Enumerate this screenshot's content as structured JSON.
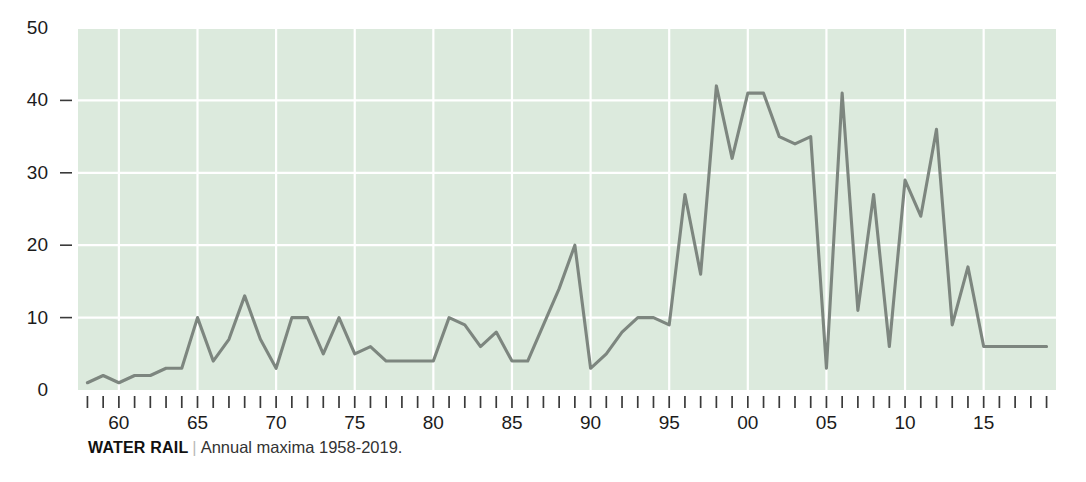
{
  "caption": {
    "species": "WATER RAIL",
    "separator": "|",
    "subtitle": "Annual maxima 1958-2019."
  },
  "style": {
    "plot_background": "#dceadd",
    "gridline_color": "#ffffff",
    "line_color": "#7d867f",
    "tick_color": "#3a3a3a",
    "label_color": "#1b1b1b"
  },
  "chart_data": {
    "type": "line",
    "title": "WATER RAIL",
    "subtitle": "Annual maxima 1958-2019.",
    "xlabel": "",
    "ylabel": "",
    "xlim": [
      1957.4,
      2019.6
    ],
    "ylim": [
      0,
      50
    ],
    "grid": true,
    "legend_position": "none",
    "y_ticks": [
      0,
      10,
      20,
      30,
      40,
      50
    ],
    "y_tick_labels": [
      "0",
      "10",
      "20",
      "30",
      "40",
      "50"
    ],
    "x_ticks": [
      1960,
      1965,
      1970,
      1975,
      1980,
      1985,
      1990,
      1995,
      2000,
      2005,
      2010,
      2015
    ],
    "x_tick_labels": [
      "60",
      "65",
      "70",
      "75",
      "80",
      "85",
      "90",
      "95",
      "00",
      "05",
      "10",
      "15"
    ],
    "x_minor_ticks_every": 1,
    "x": [
      1958,
      1959,
      1960,
      1961,
      1962,
      1963,
      1964,
      1965,
      1966,
      1967,
      1968,
      1969,
      1970,
      1971,
      1972,
      1973,
      1974,
      1975,
      1976,
      1977,
      1978,
      1979,
      1980,
      1981,
      1982,
      1983,
      1984,
      1985,
      1986,
      1987,
      1988,
      1989,
      1990,
      1991,
      1992,
      1993,
      1994,
      1995,
      1996,
      1997,
      1998,
      1999,
      2000,
      2001,
      2002,
      2003,
      2004,
      2005,
      2006,
      2007,
      2008,
      2009,
      2010,
      2011,
      2012,
      2013,
      2014,
      2015,
      2016,
      2017,
      2018,
      2019
    ],
    "values": [
      1,
      2,
      1,
      2,
      2,
      3,
      3,
      10,
      4,
      7,
      13,
      7,
      3,
      10,
      10,
      5,
      10,
      5,
      6,
      4,
      4,
      4,
      4,
      10,
      9,
      6,
      8,
      4,
      4,
      9,
      14,
      20,
      3,
      5,
      8,
      10,
      10,
      9,
      27,
      16,
      42,
      32,
      41,
      41,
      35,
      34,
      35,
      3,
      41,
      11,
      27,
      6,
      29,
      24,
      36,
      9,
      17,
      6,
      6,
      6,
      6,
      6
    ],
    "series": [
      {
        "name": "Water Rail annual maxima",
        "values": [
          1,
          2,
          1,
          2,
          2,
          3,
          3,
          10,
          4,
          7,
          13,
          7,
          3,
          10,
          10,
          5,
          10,
          5,
          6,
          4,
          4,
          4,
          4,
          10,
          9,
          6,
          8,
          4,
          4,
          9,
          14,
          20,
          3,
          5,
          8,
          10,
          10,
          9,
          27,
          16,
          42,
          32,
          41,
          41,
          35,
          34,
          35,
          3,
          41,
          11,
          27,
          6,
          29,
          24,
          36,
          9,
          17,
          6,
          6,
          6,
          6,
          6
        ]
      }
    ]
  }
}
